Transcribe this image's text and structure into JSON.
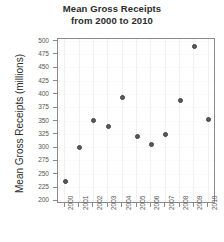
{
  "chart_data": {
    "type": "scatter",
    "title": "Mean Gross Receipts from 2000 to 2010",
    "title_lines": [
      "Mean Gross Receipts",
      "from 2000 to 2010"
    ],
    "xlabel": "",
    "ylabel": "Mean Gross Receipts (millions)",
    "categories": [
      "2000",
      "2001",
      "2002",
      "2003",
      "2004",
      "2005",
      "2006",
      "2007",
      "2008",
      "2009",
      "2010"
    ],
    "x": [
      2000,
      2001,
      2002,
      2003,
      2004,
      2005,
      2006,
      2007,
      2008,
      2009,
      2010
    ],
    "values": [
      237,
      301,
      351,
      341,
      395,
      322,
      307,
      326,
      390,
      490,
      353
    ],
    "ylim": [
      195,
      505
    ],
    "yticks": [
      200,
      225,
      250,
      275,
      300,
      325,
      350,
      375,
      400,
      425,
      450,
      475,
      500
    ],
    "ytick_labels": [
      "200",
      "225",
      "250",
      "275",
      "300",
      "325",
      "350",
      "375",
      "400",
      "425",
      "450",
      "475",
      "500"
    ],
    "xtick_labels": [
      "2000",
      "2001",
      "2002",
      "2003",
      "2004",
      "2005",
      "2006",
      "2007",
      "2008",
      "2009",
      "2010"
    ],
    "grid": true,
    "legend": null,
    "marker_color": "#5a5a5a",
    "axis_color": "#8a8a8a",
    "text_color": "#2b2b2b"
  }
}
